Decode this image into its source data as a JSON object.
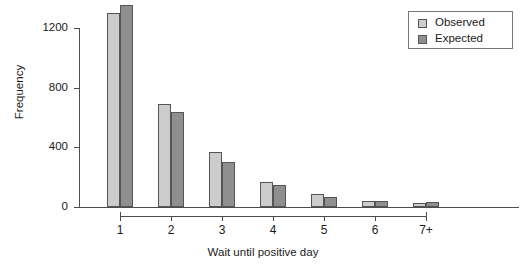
{
  "chart_data": {
    "type": "bar",
    "title": "",
    "subtitle": "",
    "xlabel": "Wait until positive day",
    "ylabel": "Frequency",
    "categories": [
      "1",
      "2",
      "3",
      "4",
      "5",
      "6",
      "7+"
    ],
    "series": [
      {
        "name": "Observed",
        "color": "#cccccc",
        "values": [
          1300,
          690,
          370,
          165,
          85,
          40,
          28
        ]
      },
      {
        "name": "Expected",
        "color": "#8f8f8f",
        "values": [
          1355,
          640,
          305,
          145,
          70,
          38,
          35
        ]
      }
    ],
    "ylim": [
      0,
      1400
    ],
    "yticks": [
      0,
      400,
      800,
      1200
    ],
    "ytick_labels": [
      "0",
      "400",
      "800",
      "1200"
    ],
    "grid": false,
    "legend_position": "top-right",
    "legend_entries": [
      "Observed",
      "Expected"
    ],
    "annotations": []
  },
  "axes": {
    "y_title": "Frequency",
    "x_title": "Wait until positive day"
  },
  "legend": {
    "items": [
      {
        "label": "Observed",
        "swatch": "observed-swatch"
      },
      {
        "label": "Expected",
        "swatch": "expected-swatch"
      }
    ]
  }
}
